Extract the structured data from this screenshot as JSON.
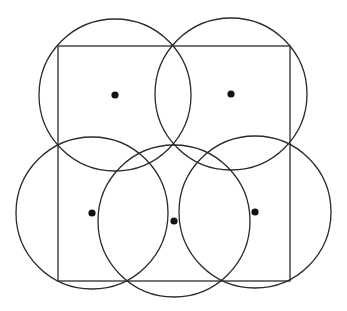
{
  "diagram": {
    "width": 347,
    "height": 311,
    "stroke_color": "#2b2b2b",
    "dot_color": "#111111",
    "stroke_width": 1.3,
    "dot_radius": 3.6,
    "rectangle": {
      "x": 58,
      "y": 46,
      "width": 232,
      "height": 235
    },
    "circles": [
      {
        "id": "top-left",
        "cx": 115,
        "cy": 95,
        "r": 76
      },
      {
        "id": "top-right",
        "cx": 231,
        "cy": 94,
        "r": 76
      },
      {
        "id": "bottom-left",
        "cx": 92,
        "cy": 213,
        "r": 76
      },
      {
        "id": "bottom-middle",
        "cx": 174,
        "cy": 221,
        "r": 76
      },
      {
        "id": "bottom-right",
        "cx": 255,
        "cy": 212,
        "r": 76
      }
    ]
  }
}
